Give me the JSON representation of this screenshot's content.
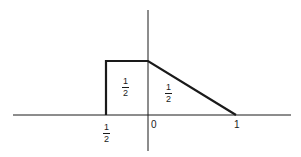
{
  "diagram": {
    "type": "piecewise-density-figure",
    "colors": {
      "line": "#1a1a1a",
      "background": "#ffffff"
    },
    "axis_labels": {
      "left_tick": {
        "num": "1",
        "den": "2"
      },
      "origin": "0",
      "right_tick": "1"
    },
    "region_labels": {
      "rectangle": {
        "num": "1",
        "den": "2"
      },
      "triangle": {
        "num": "1",
        "den": "2"
      }
    }
  }
}
